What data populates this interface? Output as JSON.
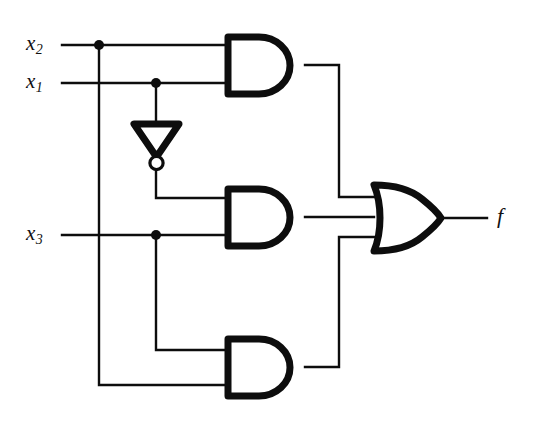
{
  "diagram": {
    "type": "digital-logic-circuit",
    "output_expression": "f",
    "stroke_color": "#0d0d0d",
    "background_color": "#ffffff",
    "canvas": {
      "width": 535,
      "height": 429
    }
  },
  "labels": {
    "input_1": {
      "base": "x",
      "sub": "2"
    },
    "input_2": {
      "base": "x",
      "sub": "1"
    },
    "input_3": {
      "base": "x",
      "sub": "3"
    },
    "output": "f"
  },
  "gates": [
    {
      "name": "and-gate-top",
      "kind": "AND",
      "inputs": 2,
      "x": 225,
      "y": 34,
      "w": 80,
      "h": 62
    },
    {
      "name": "and-gate-middle",
      "kind": "AND",
      "inputs": 2,
      "x": 225,
      "y": 186,
      "w": 80,
      "h": 62
    },
    {
      "name": "and-gate-bottom",
      "kind": "AND",
      "inputs": 2,
      "x": 225,
      "y": 336,
      "w": 80,
      "h": 62
    },
    {
      "name": "or-gate",
      "kind": "OR",
      "inputs": 3,
      "x": 371,
      "y": 182,
      "w": 72,
      "h": 72
    },
    {
      "name": "not-gate",
      "kind": "NOT",
      "inputs": 1,
      "x": 133,
      "y": 122,
      "w": 47,
      "h": 34
    }
  ],
  "junctions": [
    {
      "name": "junction-x2",
      "x": 99,
      "y": 45
    },
    {
      "name": "junction-x1",
      "x": 156,
      "y": 83
    },
    {
      "name": "junction-x3",
      "x": 156,
      "y": 235
    }
  ]
}
